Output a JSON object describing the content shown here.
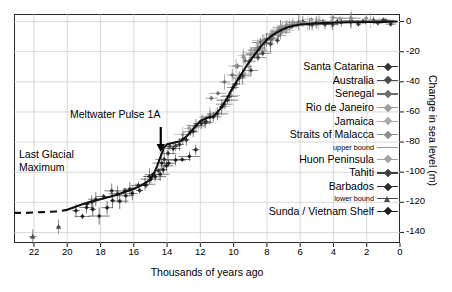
{
  "chart_data": {
    "type": "scatter",
    "title": "",
    "xlabel": "Thousands of years ago",
    "ylabel": "Change in sea level (m)",
    "xlim": [
      23.2,
      0
    ],
    "ylim": [
      -147,
      5
    ],
    "x_ticks": [
      22,
      20,
      18,
      16,
      14,
      12,
      10,
      8,
      6,
      4,
      2,
      0
    ],
    "y_ticks": [
      0,
      -20,
      -40,
      -60,
      -80,
      -100,
      -120,
      -140
    ],
    "x_axis_reversed": true,
    "grid": true,
    "legend_position": "right-inside",
    "annotations": [
      {
        "name": "last-glacial-maximum",
        "text": "Last Glacial\nMaximum",
        "x": 21.5,
        "y": -103
      },
      {
        "name": "meltwater-pulse-1a",
        "text": "Meltwater Pulse 1A",
        "x": 16.6,
        "y": -72,
        "arrow_to_x": 14.4,
        "arrow_to_y": -88
      }
    ],
    "smoothed_curve": {
      "name": "eustatic-sea-level-curve",
      "color": "#111111",
      "x": [
        20.0,
        19.5,
        19.0,
        18.5,
        18.0,
        17.5,
        17.0,
        16.5,
        16.0,
        15.5,
        15.0,
        14.8,
        14.6,
        14.4,
        14.2,
        14.0,
        13.6,
        13.2,
        12.8,
        12.4,
        12.0,
        11.6,
        11.2,
        10.8,
        10.4,
        10.0,
        9.6,
        9.2,
        8.8,
        8.4,
        8.0,
        7.6,
        7.2,
        6.8,
        6.4,
        6.0,
        5.0,
        4.0,
        3.0,
        2.0,
        1.0,
        0.2
      ],
      "y": [
        -125.0,
        -123.0,
        -121.0,
        -119.5,
        -118.0,
        -116.5,
        -115.0,
        -113.0,
        -111.0,
        -108.5,
        -105.0,
        -101.0,
        -96.0,
        -90.0,
        -84.0,
        -81.5,
        -80.5,
        -79.5,
        -76.0,
        -71.0,
        -66.0,
        -64.0,
        -63.0,
        -58.0,
        -51.0,
        -43.0,
        -36.0,
        -29.0,
        -23.0,
        -17.0,
        -12.0,
        -8.5,
        -6.0,
        -4.0,
        -2.8,
        -2.0,
        -1.2,
        -0.8,
        -0.5,
        -0.3,
        -0.2,
        0.0
      ]
    },
    "dashed_curve": {
      "name": "last-glacial-maximum-plateau",
      "color": "#111111",
      "style": "dashed",
      "x": [
        23.2,
        22.5,
        21.5,
        20.5,
        20.0
      ],
      "y": [
        -127.0,
        -127.0,
        -126.5,
        -126.0,
        -125.0
      ]
    },
    "series": [
      {
        "name": "Santa Catarina",
        "color": "#333333",
        "marker": "diamond",
        "points": [
          [
            8.6,
            -18
          ],
          [
            8.3,
            -15
          ],
          [
            8.0,
            -12
          ],
          [
            7.7,
            -9
          ],
          [
            7.4,
            -7
          ],
          [
            7.1,
            -5
          ],
          [
            6.8,
            -3
          ],
          [
            6.4,
            -2
          ],
          [
            6.0,
            -1.5
          ],
          [
            5.5,
            -1.0
          ],
          [
            5.0,
            -0.8
          ],
          [
            4.5,
            -0.6
          ],
          [
            4.0,
            -0.5
          ],
          [
            3.5,
            -0.4
          ],
          [
            3.0,
            -0.4
          ],
          [
            2.5,
            -0.3
          ],
          [
            2.0,
            -0.3
          ],
          [
            1.5,
            -0.2
          ],
          [
            1.0,
            -0.2
          ],
          [
            0.6,
            -0.1
          ]
        ]
      },
      {
        "name": "Australia",
        "color": "#4a4a4a",
        "marker": "diamond",
        "points": [
          [
            9.0,
            -26
          ],
          [
            8.7,
            -22
          ],
          [
            8.4,
            -18
          ],
          [
            8.1,
            -14
          ],
          [
            7.8,
            -11
          ],
          [
            7.5,
            -8
          ],
          [
            7.2,
            -6
          ],
          [
            6.9,
            -4
          ],
          [
            6.6,
            -3
          ],
          [
            6.2,
            -2
          ],
          [
            5.8,
            -1.5
          ],
          [
            5.2,
            -1.0
          ],
          [
            4.6,
            -0.8
          ],
          [
            3.8,
            -0.6
          ],
          [
            3.0,
            -0.5
          ],
          [
            2.2,
            -0.4
          ],
          [
            1.4,
            -0.3
          ],
          [
            0.8,
            -0.2
          ]
        ]
      },
      {
        "name": "Senegal",
        "color": "#6d6d6d",
        "marker": "diamond",
        "points": [
          [
            11.4,
            -52
          ],
          [
            10.9,
            -46
          ],
          [
            10.5,
            -41
          ],
          [
            10.1,
            -36
          ],
          [
            9.7,
            -31
          ],
          [
            9.3,
            -27
          ],
          [
            8.9,
            -23
          ],
          [
            8.5,
            -19
          ],
          [
            8.1,
            -15
          ],
          [
            7.7,
            -11
          ],
          [
            7.3,
            -8
          ],
          [
            6.9,
            -5
          ],
          [
            6.5,
            -3
          ],
          [
            6.0,
            -2
          ]
        ]
      },
      {
        "name": "Rio de Janeiro",
        "color": "#9a9a9a",
        "marker": "diamond",
        "points": [
          [
            7.6,
            -7
          ],
          [
            7.2,
            -5
          ],
          [
            6.8,
            -3
          ],
          [
            6.4,
            -2
          ],
          [
            6.0,
            -1
          ],
          [
            5.4,
            0.5
          ],
          [
            4.8,
            1.0
          ],
          [
            4.2,
            1.2
          ],
          [
            3.6,
            1.0
          ],
          [
            3.0,
            0.8
          ],
          [
            2.4,
            0.6
          ],
          [
            1.8,
            0.4
          ],
          [
            1.2,
            0.2
          ]
        ]
      },
      {
        "name": "Jamaica",
        "color": "#a8a8a8",
        "marker": "diamond",
        "points": [
          [
            9.4,
            -24
          ],
          [
            9.0,
            -20
          ],
          [
            8.6,
            -16
          ],
          [
            8.2,
            -13
          ],
          [
            7.8,
            -10
          ],
          [
            7.4,
            -7
          ],
          [
            7.0,
            -5
          ],
          [
            6.6,
            -3
          ],
          [
            6.2,
            -2
          ],
          [
            5.6,
            -1
          ]
        ]
      },
      {
        "name": "Straits of Malacca",
        "color": "#8e8e8e",
        "marker": "diamond",
        "points": [
          [
            9.8,
            -30
          ],
          [
            9.4,
            -25
          ],
          [
            9.0,
            -21
          ],
          [
            8.6,
            -17
          ],
          [
            8.2,
            -13
          ],
          [
            7.8,
            -10
          ],
          [
            7.4,
            -7
          ],
          [
            7.0,
            -4
          ],
          [
            6.6,
            -2
          ],
          [
            6.0,
            -0.5
          ],
          [
            5.0,
            0.8
          ],
          [
            4.0,
            1.2
          ],
          [
            3.0,
            1.0
          ],
          [
            2.0,
            0.6
          ]
        ]
      },
      {
        "name": "upper bound",
        "color": "#9a9a9a",
        "marker": "bar-only",
        "sublabel": true,
        "points": []
      },
      {
        "name": "Huon Peninsula",
        "color": "#a0a0a0",
        "marker": "diamond",
        "points": [
          [
            13.0,
            -76
          ],
          [
            12.6,
            -72
          ],
          [
            12.2,
            -68
          ],
          [
            11.8,
            -65
          ],
          [
            11.4,
            -63
          ],
          [
            11.0,
            -61
          ],
          [
            10.6,
            -55
          ],
          [
            10.2,
            -48
          ],
          [
            9.8,
            -41
          ],
          [
            9.4,
            -35
          ],
          [
            9.0,
            -29
          ],
          [
            8.6,
            -24
          ],
          [
            8.2,
            -19
          ]
        ]
      },
      {
        "name": "Tahiti",
        "color": "#404040",
        "marker": "diamond",
        "points": [
          [
            13.8,
            -84
          ],
          [
            13.4,
            -82
          ],
          [
            13.0,
            -79
          ],
          [
            12.6,
            -74
          ],
          [
            12.2,
            -70
          ],
          [
            11.8,
            -66
          ],
          [
            11.4,
            -64
          ],
          [
            11.0,
            -62
          ],
          [
            10.6,
            -56
          ],
          [
            10.2,
            -50
          ],
          [
            9.8,
            -43
          ],
          [
            9.4,
            -37
          ],
          [
            9.0,
            -31
          ],
          [
            8.6,
            -25
          ],
          [
            8.2,
            -20
          ],
          [
            7.8,
            -15
          ],
          [
            7.4,
            -11
          ]
        ]
      },
      {
        "name": "Barbados",
        "color": "#2c2c2c",
        "marker": "diamond",
        "points": [
          [
            18.9,
            -122
          ],
          [
            18.6,
            -119
          ],
          [
            18.2,
            -118
          ],
          [
            17.8,
            -116
          ],
          [
            17.4,
            -114
          ],
          [
            17.0,
            -114
          ],
          [
            16.6,
            -112
          ],
          [
            16.2,
            -111
          ],
          [
            15.8,
            -109
          ],
          [
            15.4,
            -107
          ],
          [
            15.0,
            -104
          ],
          [
            14.8,
            -101
          ],
          [
            14.6,
            -98
          ],
          [
            14.4,
            -94
          ],
          [
            14.2,
            -91
          ],
          [
            14.0,
            -88
          ],
          [
            13.6,
            -85
          ],
          [
            13.2,
            -81
          ],
          [
            12.8,
            -78
          ],
          [
            12.4,
            -74
          ],
          [
            12.0,
            -68
          ],
          [
            11.6,
            -65
          ],
          [
            11.2,
            -63
          ],
          [
            10.8,
            -58
          ],
          [
            10.4,
            -52
          ],
          [
            10.0,
            -44
          ],
          [
            9.6,
            -38
          ]
        ]
      },
      {
        "name": "lower bound",
        "color": "#4a4a4a",
        "marker": "triangle",
        "sublabel": true,
        "points": [
          [
            22.0,
            -143
          ],
          [
            20.6,
            -135
          ]
        ]
      },
      {
        "name": "Sunda / Vietnam Shelf",
        "color": "#1f1f1f",
        "marker": "diamond",
        "points": [
          [
            19.4,
            -127
          ],
          [
            19.1,
            -130
          ],
          [
            18.8,
            -124
          ],
          [
            18.4,
            -126
          ],
          [
            18.0,
            -129
          ],
          [
            17.6,
            -122
          ],
          [
            17.2,
            -120
          ],
          [
            16.8,
            -118
          ],
          [
            16.4,
            -116
          ],
          [
            16.0,
            -114
          ],
          [
            15.6,
            -111
          ],
          [
            15.2,
            -108
          ],
          [
            14.9,
            -104
          ],
          [
            14.7,
            -102
          ],
          [
            14.5,
            -100
          ],
          [
            14.3,
            -99
          ],
          [
            14.1,
            -97
          ],
          [
            13.9,
            -95
          ],
          [
            13.5,
            -92
          ],
          [
            13.1,
            -90
          ],
          [
            12.7,
            -88
          ],
          [
            12.3,
            -86
          ]
        ]
      }
    ]
  },
  "legend": {
    "items": [
      {
        "label": "Santa Catarina",
        "marker": "diamond",
        "color": "#333333",
        "small": false
      },
      {
        "label": "Australia",
        "marker": "diamond",
        "color": "#4a4a4a",
        "small": false
      },
      {
        "label": "Senegal",
        "marker": "diamond",
        "color": "#6d6d6d",
        "small": false
      },
      {
        "label": "Rio de Janeiro",
        "marker": "diamond",
        "color": "#9d9d9d",
        "small": false
      },
      {
        "label": "Jamaica",
        "marker": "diamond",
        "color": "#aaaaaa",
        "small": false
      },
      {
        "label": "Straits of Malacca",
        "marker": "diamond",
        "color": "#8e8e8e",
        "small": false
      },
      {
        "label": "upper bound",
        "marker": "bar",
        "color": "#9a9a9a",
        "small": true
      },
      {
        "label": "Huon Peninsula",
        "marker": "diamond",
        "color": "#a0a0a0",
        "small": false
      },
      {
        "label": "Tahiti",
        "marker": "diamond",
        "color": "#3d3d3d",
        "small": false
      },
      {
        "label": "Barbados",
        "marker": "diamond",
        "color": "#2c2c2c",
        "small": false
      },
      {
        "label": "lower bound",
        "marker": "triangle",
        "color": "#4a4a4a",
        "small": true
      },
      {
        "label": "Sunda / Vietnam Shelf",
        "marker": "diamond",
        "color": "#1f1f1f",
        "small": false
      }
    ]
  },
  "axes": {
    "x_title": "Thousands of years ago",
    "y_title": "Change in sea level (m)",
    "x_tick_labels": [
      "22",
      "20",
      "18",
      "16",
      "14",
      "12",
      "10",
      "8",
      "6",
      "4",
      "2",
      "0"
    ],
    "y_tick_labels": [
      "0",
      "-20",
      "-40",
      "-60",
      "-80",
      "-100",
      "-120",
      "-140"
    ]
  },
  "annotations": {
    "lgm_line1": "Last Glacial",
    "lgm_line2": "Maximum",
    "mwp": "Meltwater Pulse 1A"
  },
  "colors": {
    "axis": "#2a2a2a",
    "grid": "#c9c9c9",
    "curve": "#111111",
    "background": "#ffffff"
  }
}
